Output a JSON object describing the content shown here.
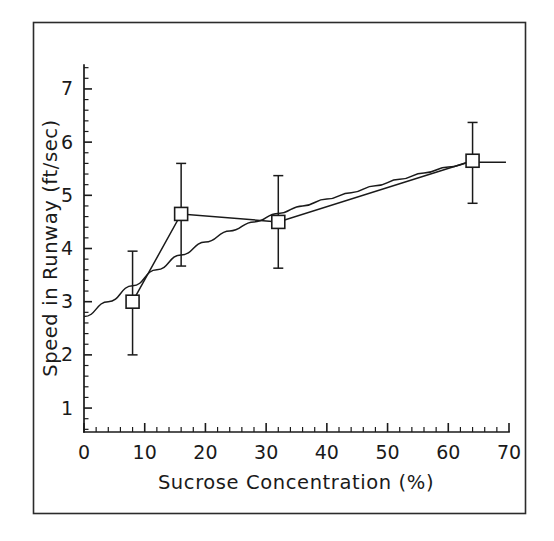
{
  "figure": {
    "background_color": "#ffffff",
    "ink_color": "#1a1a1a",
    "border_color": "#2b2b2b",
    "width": 554,
    "height": 541
  },
  "chart_data": {
    "type": "line",
    "title": "",
    "subtitle": "",
    "xlabel": "Sucrose Concentration (%)",
    "ylabel": "Speed in Runway (ft/sec)",
    "xlim": [
      0,
      70
    ],
    "ylim": [
      0.55,
      7.45
    ],
    "grid": false,
    "legend": null,
    "legend_position": "none",
    "x_major_ticks": [
      0,
      10,
      20,
      30,
      40,
      50,
      60,
      70
    ],
    "x_tick_labels": [
      "0",
      "10",
      "20",
      "30",
      "40",
      "50",
      "60",
      "70"
    ],
    "x_minor_tick_step": 2,
    "y_major_ticks": [
      1,
      2,
      3,
      4,
      5,
      6,
      7
    ],
    "y_tick_labels": [
      "1",
      "2",
      "3",
      "4",
      "5",
      "6",
      "7"
    ],
    "y_minor_tick_step": 0.2,
    "marker_style": "open-square",
    "error_bar_style": "vertical-capped",
    "series": [
      {
        "name": "Mean speed",
        "x": [
          8,
          16,
          32,
          64
        ],
        "values": [
          3.0,
          4.65,
          4.5,
          5.65
        ],
        "yerr_low": [
          1.0,
          0.98,
          0.87,
          0.8
        ],
        "yerr_high": [
          0.95,
          0.95,
          0.87,
          0.72
        ]
      },
      {
        "name": "Fitted curve",
        "x": [
          0,
          4,
          8,
          12,
          16,
          20,
          24,
          28,
          32,
          36,
          40,
          44,
          48,
          52,
          56,
          60,
          64,
          69.5
        ],
        "values": [
          2.72,
          3.0,
          3.3,
          3.6,
          3.88,
          4.12,
          4.33,
          4.5,
          4.66,
          4.8,
          4.93,
          5.05,
          5.18,
          5.3,
          5.42,
          5.53,
          5.62,
          5.62
        ]
      }
    ],
    "annotations": []
  },
  "axis_labels": {
    "x_title": "Sucrose Concentration (%)",
    "y_title": "Speed in Runway (ft/sec)"
  }
}
